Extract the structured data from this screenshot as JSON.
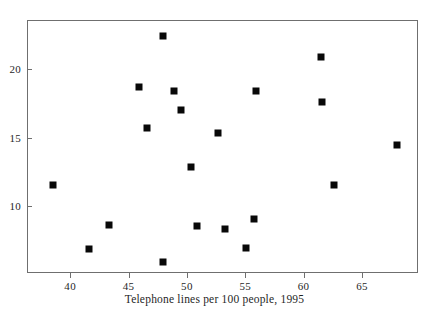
{
  "chart_data": {
    "type": "scatter",
    "title": "",
    "subtitle": "",
    "xlabel": "Telephone lines per 100 people, 1995",
    "ylabel": "",
    "xlim": [
      36.3,
      69.8
    ],
    "ylim": [
      5.1,
      23.6
    ],
    "grid": false,
    "legend": null,
    "marker": {
      "shape": "square",
      "color": "#080808",
      "size_px": 7
    },
    "xticks": [
      40,
      45,
      50,
      55,
      60,
      65
    ],
    "xticklabels": [
      "40",
      "45",
      "50",
      "55",
      "60",
      "65"
    ],
    "yticks": [
      10,
      15,
      20
    ],
    "yticklabels": [
      "10",
      "15",
      "20"
    ],
    "points": [
      {
        "x": 38.4,
        "y": 11.6
      },
      {
        "x": 41.5,
        "y": 6.9
      },
      {
        "x": 43.2,
        "y": 8.7
      },
      {
        "x": 45.8,
        "y": 18.8
      },
      {
        "x": 46.5,
        "y": 15.8
      },
      {
        "x": 47.9,
        "y": 22.5
      },
      {
        "x": 47.9,
        "y": 6.0
      },
      {
        "x": 48.8,
        "y": 18.5
      },
      {
        "x": 49.4,
        "y": 17.1
      },
      {
        "x": 50.3,
        "y": 12.9
      },
      {
        "x": 50.8,
        "y": 8.6
      },
      {
        "x": 52.6,
        "y": 15.4
      },
      {
        "x": 53.2,
        "y": 8.4
      },
      {
        "x": 55.0,
        "y": 7.0
      },
      {
        "x": 55.7,
        "y": 9.1
      },
      {
        "x": 55.8,
        "y": 18.5
      },
      {
        "x": 61.4,
        "y": 21.0
      },
      {
        "x": 61.5,
        "y": 17.7
      },
      {
        "x": 62.5,
        "y": 11.6
      },
      {
        "x": 67.9,
        "y": 14.5
      }
    ]
  }
}
